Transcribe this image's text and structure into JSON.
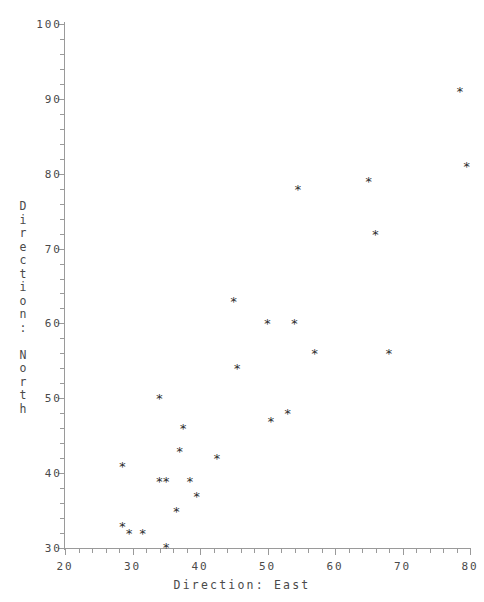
{
  "chart_data": {
    "type": "scatter",
    "title": "",
    "xlabel": "Direction: East",
    "ylabel": "Direction: North",
    "xlim": [
      20,
      80
    ],
    "ylim": [
      30,
      100
    ],
    "xticks": [
      20,
      30,
      40,
      50,
      60,
      70,
      80
    ],
    "yticks": [
      30,
      40,
      50,
      60,
      70,
      80,
      90,
      100
    ],
    "xtick_labels": [
      "20",
      "30",
      "40",
      "50",
      "60",
      "70",
      "80"
    ],
    "ytick_labels": [
      "30",
      "40",
      "50",
      "60",
      "70",
      "80",
      "90",
      "100"
    ],
    "minor_ticks_per_interval": 5,
    "grid": false,
    "legend": null,
    "marker_glyph": "*",
    "marker_color": "#2e2e2e",
    "axis_color": "#9a9a9a",
    "background": "#ffffff",
    "points": [
      {
        "x": 28.5,
        "y": 41.0
      },
      {
        "x": 28.5,
        "y": 33.0
      },
      {
        "x": 29.5,
        "y": 32.0
      },
      {
        "x": 31.5,
        "y": 32.0
      },
      {
        "x": 34.0,
        "y": 50.0
      },
      {
        "x": 34.0,
        "y": 39.0
      },
      {
        "x": 35.0,
        "y": 39.0
      },
      {
        "x": 35.0,
        "y": 30.2
      },
      {
        "x": 36.5,
        "y": 35.0
      },
      {
        "x": 37.0,
        "y": 43.0
      },
      {
        "x": 37.5,
        "y": 46.0
      },
      {
        "x": 38.5,
        "y": 39.0
      },
      {
        "x": 39.5,
        "y": 37.0
      },
      {
        "x": 42.5,
        "y": 42.0
      },
      {
        "x": 45.0,
        "y": 63.0
      },
      {
        "x": 45.5,
        "y": 54.0
      },
      {
        "x": 50.5,
        "y": 47.0
      },
      {
        "x": 50.0,
        "y": 60.0
      },
      {
        "x": 53.0,
        "y": 48.0
      },
      {
        "x": 54.0,
        "y": 60.0
      },
      {
        "x": 54.5,
        "y": 78.0
      },
      {
        "x": 57.0,
        "y": 56.0
      },
      {
        "x": 65.0,
        "y": 79.0
      },
      {
        "x": 66.0,
        "y": 72.0
      },
      {
        "x": 68.0,
        "y": 56.0
      },
      {
        "x": 78.5,
        "y": 91.0
      },
      {
        "x": 79.5,
        "y": 81.0
      }
    ]
  },
  "axis_titles": {
    "x": "Direction: East",
    "y_chars": [
      "D",
      "i",
      "r",
      "e",
      "c",
      "t",
      "i",
      "o",
      "n",
      ":",
      "",
      "N",
      "o",
      "r",
      "t",
      "h"
    ]
  },
  "top_title": ""
}
